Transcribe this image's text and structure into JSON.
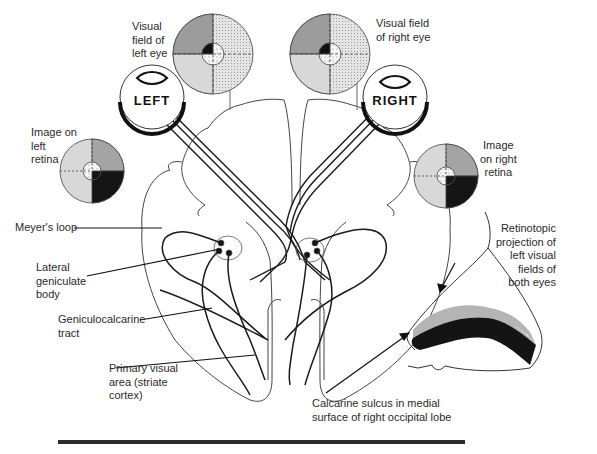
{
  "labels": {
    "visual_field_left": "Visual\nfield of\nleft eye",
    "visual_field_right": "Visual field\nof right eye",
    "image_left_retina": "Image on\nleft\nretina",
    "image_right_retina": "Image\non right\nretina",
    "meyers_loop": "Meyer's loop",
    "lateral_geniculate": "Lateral\ngeniculate\nbody",
    "geniculocalcarine": "Geniculocalcarine\ntract",
    "primary_visual": "Primary visual\narea (striate\ncortex)",
    "retinotopic": "Retinotopic\nprojection of\nleft visual\nfields of\nboth eyes",
    "calcarine": "Calcarine sulcus in medial\nsurface of right occipital lobe"
  },
  "eyes": {
    "left": "LEFT",
    "right": "RIGHT"
  },
  "colors": {
    "line": "#222222",
    "light_stipple": "#dcdcdc",
    "mid_gray": "#a8a8a8",
    "dark_gray": "#8c8c8c",
    "black": "#151515"
  }
}
